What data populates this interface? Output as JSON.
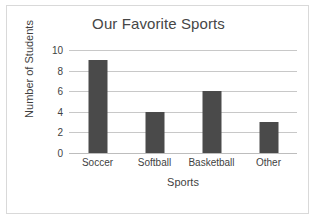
{
  "chart_data": {
    "type": "bar",
    "title": "Our Favorite Sports",
    "xlabel": "Sports",
    "ylabel": "Number of Students",
    "categories": [
      "Soccer",
      "Softball",
      "Basketball",
      "Other"
    ],
    "values": [
      9,
      4,
      6,
      3
    ],
    "ylim": [
      0,
      10
    ],
    "yticks": [
      0,
      2,
      4,
      6,
      8,
      10
    ],
    "grid": true,
    "legend": false,
    "colors": {
      "bar": "#4a4a4a",
      "gridline": "#c8c8c8",
      "text": "#3f3f3f",
      "title_text": "#464646",
      "border": "#d9d9d9",
      "background": "#ffffff"
    }
  }
}
